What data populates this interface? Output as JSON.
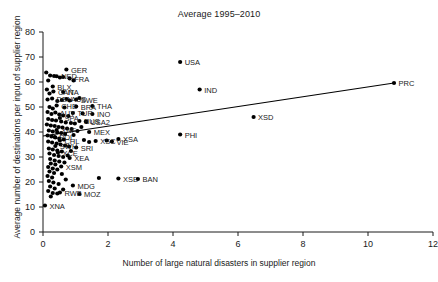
{
  "chart_data": {
    "type": "scatter",
    "title": "Average 1995–2010",
    "xlabel": "Number of large natural disasters in supplier region",
    "ylabel": "Average number of destinations per input of supplier region",
    "xlim": [
      0,
      12
    ],
    "ylim": [
      0,
      80
    ],
    "xticks": [
      0,
      2,
      4,
      6,
      8,
      10,
      12
    ],
    "yticks": [
      0,
      10,
      20,
      30,
      40,
      50,
      60,
      70,
      80
    ],
    "grid": false,
    "legend": null,
    "marker_color": "#000000",
    "marker_shape": "circle",
    "trendline": {
      "type": "linear-fit",
      "color": "#000000",
      "x_start": 0.0,
      "y_start": 38.4,
      "x_end": 10.8,
      "y_end": 59.6
    },
    "points": [
      {
        "label": "GER",
        "x": 0.72,
        "y": 65.0,
        "label_pos": "right"
      },
      {
        "label": "NED",
        "x": 0.42,
        "y": 62.3,
        "label_pos": "right"
      },
      {
        "label": "FRA",
        "x": 0.82,
        "y": 61.4,
        "label_pos": "right"
      },
      {
        "label": "BLX",
        "x": 0.3,
        "y": 58.2,
        "label_pos": "right"
      },
      {
        "label": "CAN",
        "x": 0.32,
        "y": 56.2,
        "label_pos": "right"
      },
      {
        "label": "ITA",
        "x": 0.62,
        "y": 56.0,
        "label_pos": "right"
      },
      {
        "label": "DEN",
        "x": 0.28,
        "y": 53.4,
        "label_pos": "right"
      },
      {
        "label": "AUS",
        "x": 0.72,
        "y": 53.2,
        "label_pos": "right"
      },
      {
        "label": "SWE",
        "x": 1.02,
        "y": 53.0,
        "label_pos": "right"
      },
      {
        "label": "CHE",
        "x": 0.42,
        "y": 50.6,
        "label_pos": "right"
      },
      {
        "label": "BRA",
        "x": 1.02,
        "y": 50.2,
        "label_pos": "right"
      },
      {
        "label": "THA",
        "x": 1.52,
        "y": 50.4,
        "label_pos": "right"
      },
      {
        "label": "AUT",
        "x": 0.38,
        "y": 47.8,
        "label_pos": "right"
      },
      {
        "label": "TUR",
        "x": 0.92,
        "y": 47.6,
        "label_pos": "right"
      },
      {
        "label": "INO",
        "x": 1.52,
        "y": 47.2,
        "label_pos": "right"
      },
      {
        "label": "SPA",
        "x": 0.52,
        "y": 45.6,
        "label_pos": "right"
      },
      {
        "label": "RUS",
        "x": 1.12,
        "y": 44.4,
        "label_pos": "right"
      },
      {
        "label": "USA2",
        "x": 1.32,
        "y": 44.2,
        "label_pos": "right"
      },
      {
        "label": "XNF",
        "x": 0.42,
        "y": 40.8,
        "label_pos": "right"
      },
      {
        "label": "MEX",
        "x": 1.42,
        "y": 40.0,
        "label_pos": "right"
      },
      {
        "label": "POL",
        "x": 0.36,
        "y": 38.0,
        "label_pos": "right"
      },
      {
        "label": "CHL",
        "x": 0.52,
        "y": 36.6,
        "label_pos": "right"
      },
      {
        "label": "XSC",
        "x": 1.62,
        "y": 36.4,
        "label_pos": "right"
      },
      {
        "label": "VIE",
        "x": 2.12,
        "y": 36.2,
        "label_pos": "right"
      },
      {
        "label": "XSA",
        "x": 2.32,
        "y": 37.2,
        "label_pos": "right"
      },
      {
        "label": "SWH",
        "x": 0.38,
        "y": 34.4,
        "label_pos": "right"
      },
      {
        "label": "SRI",
        "x": 1.02,
        "y": 33.8,
        "label_pos": "right"
      },
      {
        "label": "XCE",
        "x": 0.46,
        "y": 31.8,
        "label_pos": "right"
      },
      {
        "label": "XEA",
        "x": 0.82,
        "y": 29.6,
        "label_pos": "right"
      },
      {
        "label": "XSM",
        "x": 0.56,
        "y": 26.2,
        "label_pos": "right"
      },
      {
        "label": "XSE",
        "x": 2.32,
        "y": 21.4,
        "label_pos": "right"
      },
      {
        "label": "BAN",
        "x": 2.92,
        "y": 21.2,
        "label_pos": "right"
      },
      {
        "label": "MDG",
        "x": 0.92,
        "y": 18.6,
        "label_pos": "right"
      },
      {
        "label": "RWB",
        "x": 0.52,
        "y": 15.8,
        "label_pos": "right"
      },
      {
        "label": "MOZ",
        "x": 1.12,
        "y": 15.2,
        "label_pos": "right"
      },
      {
        "label": "XNA",
        "x": 0.06,
        "y": 10.6,
        "label_pos": "right"
      },
      {
        "label": "USA",
        "x": 4.22,
        "y": 68.0,
        "label_pos": "right"
      },
      {
        "label": "IND",
        "x": 4.82,
        "y": 57.0,
        "label_pos": "right"
      },
      {
        "label": "XSD",
        "x": 6.48,
        "y": 46.0,
        "label_pos": "right"
      },
      {
        "label": "PRC",
        "x": 10.8,
        "y": 59.6,
        "label_pos": "right"
      },
      {
        "label": "PHI",
        "x": 4.22,
        "y": 39.0,
        "label_pos": "right"
      }
    ],
    "unlabeled_points": [
      {
        "x": 0.1,
        "y": 63.8
      },
      {
        "x": 0.22,
        "y": 62.6
      },
      {
        "x": 0.34,
        "y": 62.4
      },
      {
        "x": 0.16,
        "y": 60.6
      },
      {
        "x": 0.52,
        "y": 61.8
      },
      {
        "x": 0.62,
        "y": 62.0
      },
      {
        "x": 0.12,
        "y": 57.0
      },
      {
        "x": 0.2,
        "y": 55.4
      },
      {
        "x": 0.14,
        "y": 53.0
      },
      {
        "x": 0.44,
        "y": 52.4
      },
      {
        "x": 0.58,
        "y": 52.8
      },
      {
        "x": 0.82,
        "y": 52.6
      },
      {
        "x": 0.2,
        "y": 50.0
      },
      {
        "x": 0.3,
        "y": 49.4
      },
      {
        "x": 0.66,
        "y": 49.8
      },
      {
        "x": 0.14,
        "y": 48.0
      },
      {
        "x": 0.26,
        "y": 47.2
      },
      {
        "x": 0.5,
        "y": 47.0
      },
      {
        "x": 0.62,
        "y": 46.6
      },
      {
        "x": 0.78,
        "y": 46.4
      },
      {
        "x": 0.16,
        "y": 45.2
      },
      {
        "x": 0.28,
        "y": 44.8
      },
      {
        "x": 0.4,
        "y": 44.6
      },
      {
        "x": 0.56,
        "y": 44.2
      },
      {
        "x": 0.7,
        "y": 43.8
      },
      {
        "x": 0.86,
        "y": 43.6
      },
      {
        "x": 0.98,
        "y": 43.4
      },
      {
        "x": 0.12,
        "y": 43.0
      },
      {
        "x": 0.24,
        "y": 42.6
      },
      {
        "x": 0.36,
        "y": 42.4
      },
      {
        "x": 0.48,
        "y": 42.0
      },
      {
        "x": 0.6,
        "y": 41.8
      },
      {
        "x": 0.74,
        "y": 41.4
      },
      {
        "x": 0.88,
        "y": 41.2
      },
      {
        "x": 0.18,
        "y": 40.6
      },
      {
        "x": 0.3,
        "y": 40.2
      },
      {
        "x": 0.44,
        "y": 39.8
      },
      {
        "x": 0.56,
        "y": 39.6
      },
      {
        "x": 0.68,
        "y": 39.2
      },
      {
        "x": 0.14,
        "y": 38.6
      },
      {
        "x": 0.26,
        "y": 38.2
      },
      {
        "x": 0.38,
        "y": 37.8
      },
      {
        "x": 0.5,
        "y": 37.4
      },
      {
        "x": 0.64,
        "y": 37.0
      },
      {
        "x": 0.16,
        "y": 36.2
      },
      {
        "x": 0.28,
        "y": 35.8
      },
      {
        "x": 0.42,
        "y": 35.4
      },
      {
        "x": 0.54,
        "y": 35.0
      },
      {
        "x": 0.68,
        "y": 34.6
      },
      {
        "x": 0.8,
        "y": 34.2
      },
      {
        "x": 0.18,
        "y": 33.4
      },
      {
        "x": 0.3,
        "y": 33.0
      },
      {
        "x": 0.44,
        "y": 32.6
      },
      {
        "x": 0.58,
        "y": 32.2
      },
      {
        "x": 0.2,
        "y": 31.4
      },
      {
        "x": 0.34,
        "y": 30.8
      },
      {
        "x": 0.48,
        "y": 30.4
      },
      {
        "x": 0.62,
        "y": 30.0
      },
      {
        "x": 0.22,
        "y": 29.2
      },
      {
        "x": 0.36,
        "y": 28.6
      },
      {
        "x": 0.5,
        "y": 28.2
      },
      {
        "x": 0.24,
        "y": 27.4
      },
      {
        "x": 0.38,
        "y": 27.0
      },
      {
        "x": 0.16,
        "y": 26.0
      },
      {
        "x": 0.3,
        "y": 25.4
      },
      {
        "x": 0.44,
        "y": 25.0
      },
      {
        "x": 0.2,
        "y": 24.2
      },
      {
        "x": 0.34,
        "y": 23.6
      },
      {
        "x": 0.14,
        "y": 22.4
      },
      {
        "x": 0.28,
        "y": 21.8
      },
      {
        "x": 0.18,
        "y": 20.4
      },
      {
        "x": 0.32,
        "y": 19.8
      },
      {
        "x": 0.22,
        "y": 18.2
      },
      {
        "x": 0.36,
        "y": 17.4
      },
      {
        "x": 0.16,
        "y": 16.4
      },
      {
        "x": 0.3,
        "y": 15.6
      },
      {
        "x": 0.44,
        "y": 15.4
      },
      {
        "x": 0.24,
        "y": 14.2
      },
      {
        "x": 0.94,
        "y": 60.6
      },
      {
        "x": 1.12,
        "y": 53.6
      },
      {
        "x": 1.22,
        "y": 47.4
      },
      {
        "x": 1.34,
        "y": 44.0
      },
      {
        "x": 1.18,
        "y": 42.0
      },
      {
        "x": 1.06,
        "y": 40.4
      },
      {
        "x": 0.94,
        "y": 38.8
      },
      {
        "x": 1.26,
        "y": 36.8
      },
      {
        "x": 1.42,
        "y": 36.0
      },
      {
        "x": 0.86,
        "y": 32.4
      },
      {
        "x": 0.76,
        "y": 30.6
      },
      {
        "x": 0.66,
        "y": 27.8
      },
      {
        "x": 0.58,
        "y": 23.2
      },
      {
        "x": 0.7,
        "y": 21.0
      },
      {
        "x": 0.48,
        "y": 19.2
      },
      {
        "x": 0.62,
        "y": 17.0
      },
      {
        "x": 1.96,
        "y": 36.6
      },
      {
        "x": 1.72,
        "y": 21.6
      }
    ]
  }
}
